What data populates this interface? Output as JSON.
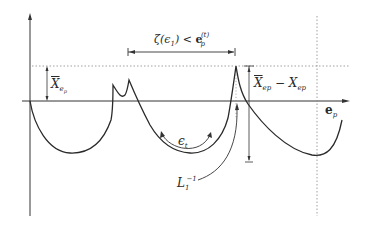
{
  "figure": {
    "type": "diagram",
    "labels": {
      "zeta_label": "ζ(ϵ₁) < e_p^(t)",
      "zeta_main": "ζ(ϵ",
      "zeta_sub": "1",
      "zeta_rest": ") < ",
      "zeta_e": "e",
      "zeta_e_sub": "p",
      "zeta_e_sup": "(t)",
      "xbar": "X",
      "xbar_sub": "e",
      "xbar_subsub": "p",
      "diff_left": "X",
      "diff_left_sub": "ep",
      "diff_minus": " − ",
      "diff_right": "X",
      "diff_right_sub": "ep",
      "axis_label": "e",
      "axis_label_sub": "p",
      "epsilon": "ϵ",
      "epsilon_sub": "t",
      "L": "L",
      "L_sub": "1",
      "L_sup": "−1"
    },
    "colors": {
      "line": "#2a2a2a",
      "dotted": "#888888"
    }
  }
}
